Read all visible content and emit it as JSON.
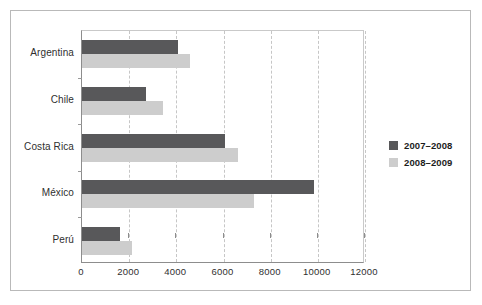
{
  "chart_data": {
    "type": "bar",
    "orientation": "horizontal",
    "title": "",
    "subtitle": "",
    "xlabel": "",
    "ylabel": "",
    "categories": [
      "Argentina",
      "Chile",
      "Costa Rica",
      "México",
      "Perú"
    ],
    "series": [
      {
        "name": "2007–2008",
        "color": "#58585a",
        "values": [
          4050,
          2700,
          6050,
          9850,
          1600
        ]
      },
      {
        "name": "2008–2009",
        "color": "#cdcdcd",
        "values": [
          4600,
          3450,
          6600,
          7300,
          2100
        ]
      }
    ],
    "xlim": [
      0,
      12000
    ],
    "xticks": [
      0,
      2000,
      4000,
      6000,
      8000,
      10000,
      12000
    ],
    "xtick_labels": [
      "0",
      "2000",
      "4000",
      "6000",
      "8000",
      "10000",
      "12000"
    ],
    "grid": {
      "vertical": true,
      "horizontal": false,
      "style": "dashed",
      "color": "#c6c6c6"
    },
    "legend": {
      "position": "right",
      "entries": [
        "2007–2008",
        "2008–2009"
      ]
    }
  },
  "figure": {
    "background_color": "#ffffff",
    "frame_color": "#b9b9b9",
    "axis_color": "#8d8d8d"
  }
}
